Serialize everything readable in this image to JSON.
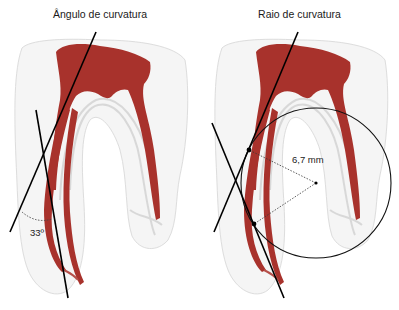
{
  "panels": [
    {
      "id": "angle",
      "title": "Ângulo de curvatura",
      "measurement_label": "33º",
      "measurement_type": "angle",
      "measurement_value_degrees": 33
    },
    {
      "id": "radius",
      "title": "Raio de curvatura",
      "measurement_label": "6,7 mm",
      "measurement_type": "radius",
      "measurement_value_mm": 6.7
    }
  ],
  "colors": {
    "pulp": "#a8322c",
    "pulp_dark": "#8e2420",
    "tooth_outline": "#d9d9d9",
    "line": "#000000"
  }
}
